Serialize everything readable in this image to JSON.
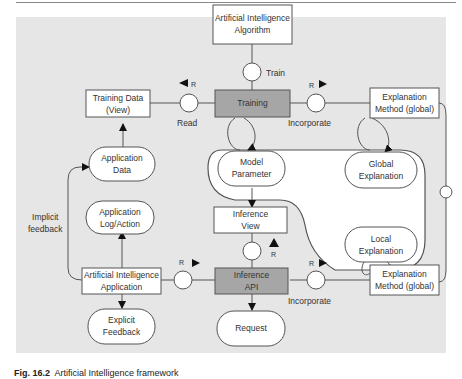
{
  "diagram": {
    "nodes": {
      "ai_algorithm": {
        "line1": "Artificial Intelligence",
        "line2": "Algorithm"
      },
      "training_data": {
        "line1": "Training Data",
        "line2": "(View)"
      },
      "training": {
        "label": "Training"
      },
      "explanation_method_top": {
        "line1": "Explanation",
        "line2": "Method  (global)"
      },
      "application_data": {
        "line1": "Application",
        "line2": "Data"
      },
      "model_parameter": {
        "line1": "Model",
        "line2": "Parameter"
      },
      "global_explanation": {
        "line1": "Global",
        "line2": "Explanation"
      },
      "application_log": {
        "line1": "Application",
        "line2": "Log/Action"
      },
      "inference_view": {
        "line1": "Inference",
        "line2": "View"
      },
      "local_explanation": {
        "line1": "Local",
        "line2": "Explanation"
      },
      "ai_application": {
        "line1": "Artificial Intelligence",
        "line2": "Application"
      },
      "inference_api": {
        "line1": "Inference",
        "line2": "API"
      },
      "explanation_method_bottom": {
        "line1": "Explanation",
        "line2": "Method  (global)"
      },
      "explicit_feedback": {
        "line1": "Explicit",
        "line2": "Feedback"
      },
      "request": {
        "label": "Request"
      }
    },
    "edge_labels": {
      "train": "Train",
      "read": "Read",
      "incorporate_top": "Incorporate",
      "incorporate_bottom": "Incorporate",
      "implicit_feedback_1": "Implicit",
      "implicit_feedback_2": "feedback",
      "r": "R"
    },
    "colors": {
      "background": "#e6e6e6",
      "box_fill": "#ffffff",
      "active_fill": "#a6a6a6",
      "stroke": "#555555"
    }
  },
  "caption": {
    "prefix": "Fig. 16.2",
    "text": "Artificial Intelligence framework"
  }
}
